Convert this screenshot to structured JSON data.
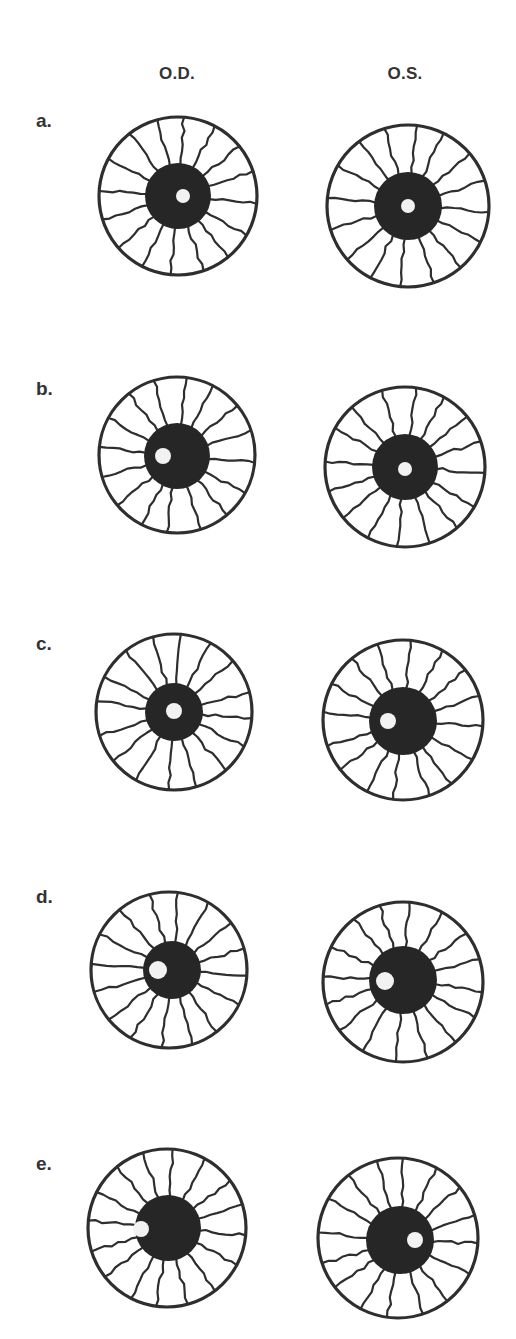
{
  "figure": {
    "columns": [
      {
        "label": "O.D.",
        "x": 177
      },
      {
        "label": "O.S.",
        "x": 405
      }
    ],
    "colors": {
      "ink": "#2e2e2e",
      "pupil": "#262626",
      "reflex": "#f2f2f2",
      "background": "#ffffff"
    },
    "spoke_count": 16,
    "rows": [
      {
        "label": "a.",
        "label_y": 110,
        "eyes": [
          {
            "side": "O.D.",
            "cx": 178,
            "cy": 196,
            "r": 79,
            "pupil_r": 33,
            "pupil_cx": 178,
            "pupil_cy": 196,
            "reflex_cx": 183,
            "reflex_cy": 196,
            "reflex_r": 7
          },
          {
            "side": "O.S.",
            "cx": 408,
            "cy": 206,
            "r": 81,
            "pupil_r": 34,
            "pupil_cx": 408,
            "pupil_cy": 206,
            "reflex_cx": 408,
            "reflex_cy": 206,
            "reflex_r": 7
          }
        ]
      },
      {
        "label": "b.",
        "label_y": 378,
        "eyes": [
          {
            "side": "O.D.",
            "cx": 177,
            "cy": 455,
            "r": 78,
            "pupil_r": 33,
            "pupil_cx": 177,
            "pupil_cy": 456,
            "reflex_cx": 163,
            "reflex_cy": 456,
            "reflex_r": 8
          },
          {
            "side": "O.S.",
            "cx": 405,
            "cy": 467,
            "r": 80,
            "pupil_r": 33,
            "pupil_cx": 405,
            "pupil_cy": 467,
            "reflex_cx": 405,
            "reflex_cy": 469,
            "reflex_r": 7
          }
        ]
      },
      {
        "label": "c.",
        "label_y": 633,
        "eyes": [
          {
            "side": "O.D.",
            "cx": 174,
            "cy": 712,
            "r": 78,
            "pupil_r": 29,
            "pupil_cx": 174,
            "pupil_cy": 712,
            "reflex_cx": 174,
            "reflex_cy": 711,
            "reflex_r": 8
          },
          {
            "side": "O.S.",
            "cx": 403,
            "cy": 720,
            "r": 80,
            "pupil_r": 34,
            "pupil_cx": 403,
            "pupil_cy": 721,
            "reflex_cx": 388,
            "reflex_cy": 721,
            "reflex_r": 8
          }
        ]
      },
      {
        "label": "d.",
        "label_y": 886,
        "eyes": [
          {
            "side": "O.D.",
            "cx": 169,
            "cy": 970,
            "r": 78,
            "pupil_r": 29,
            "pupil_cx": 172,
            "pupil_cy": 970,
            "reflex_cx": 158,
            "reflex_cy": 970,
            "reflex_r": 9
          },
          {
            "side": "O.S.",
            "cx": 403,
            "cy": 982,
            "r": 80,
            "pupil_r": 34,
            "pupil_cx": 403,
            "pupil_cy": 980,
            "reflex_cx": 385,
            "reflex_cy": 981,
            "reflex_r": 9
          }
        ]
      },
      {
        "label": "e.",
        "label_y": 1153,
        "eyes": [
          {
            "side": "O.D.",
            "cx": 167,
            "cy": 1228,
            "r": 79,
            "pupil_r": 33,
            "pupil_cx": 168,
            "pupil_cy": 1228,
            "reflex_cx": 141,
            "reflex_cy": 1229,
            "reflex_r": 8
          },
          {
            "side": "O.S.",
            "cx": 398,
            "cy": 1238,
            "r": 80,
            "pupil_r": 34,
            "pupil_cx": 400,
            "pupil_cy": 1240,
            "reflex_cx": 415,
            "reflex_cy": 1240,
            "reflex_r": 8
          }
        ]
      }
    ]
  }
}
